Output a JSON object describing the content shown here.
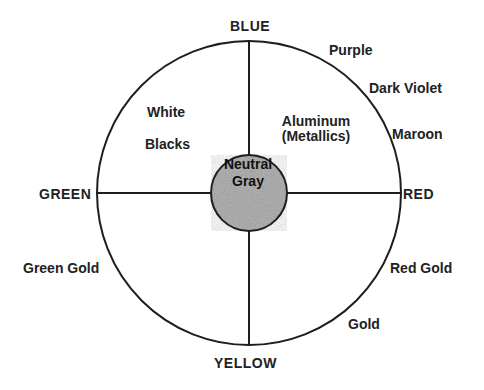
{
  "diagram": {
    "type": "color-wheel-quadrants",
    "center_label": [
      "Neutral",
      "Gray"
    ],
    "axes": {
      "top": "BLUE",
      "bottom": "YELLOW",
      "left": "GREEN",
      "right": "RED"
    },
    "perimeter_labels": {
      "purple": "Purple",
      "dark_violet": "Dark Violet",
      "maroon": "Maroon",
      "red_gold": "Red Gold",
      "gold": "Gold",
      "green_gold": "Green Gold"
    },
    "inner_labels": {
      "white": "White",
      "blacks": "Blacks",
      "aluminum": "Aluminum",
      "metallics": "(Metallics)"
    },
    "colors": {
      "line": "#1e1e1e",
      "core_fill": "#b4b4b4",
      "background": "#ffffff"
    }
  }
}
